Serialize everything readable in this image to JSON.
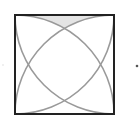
{
  "diagram": {
    "type": "geometry",
    "square": {
      "x": 15,
      "y": 15,
      "size": 99,
      "stroke": "#222222",
      "stroke_width": 2
    },
    "arcs": {
      "stroke": "#9a9a9a",
      "stroke_width": 1.6,
      "description": "Four quarter circles of radius equal to the side, each centered at a corner of the square",
      "centers": [
        "bottom-left",
        "bottom-right",
        "top-left",
        "top-right"
      ]
    },
    "shaded_region": {
      "fill": "#e4e4e4",
      "description": "Curvilinear triangle bounded by the top side and two arcs"
    },
    "marks": [
      {
        "name": "right-dot",
        "x": 137,
        "y": 66,
        "r": 1.3,
        "fill": "#555555"
      },
      {
        "name": "left-faint-mark",
        "x": 3,
        "y": 65,
        "r": 0.8,
        "fill": "#dddddd"
      }
    ]
  }
}
